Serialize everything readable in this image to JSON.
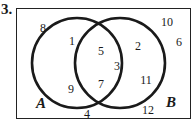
{
  "problem": {
    "number_label": "3."
  },
  "venn": {
    "sets": [
      {
        "name": "A",
        "label": "A"
      },
      {
        "name": "B",
        "label": "B"
      }
    ],
    "regions": {
      "only_A": [
        "1",
        "9"
      ],
      "intersection": [
        "5",
        "3",
        "7"
      ],
      "only_B": [
        "2",
        "11"
      ],
      "outside": [
        "8",
        "10",
        "6",
        "4",
        "12"
      ]
    },
    "numbers": {
      "n8": "8",
      "n1": "1",
      "n9": "9",
      "n5": "5",
      "n3": "3",
      "n7": "7",
      "n2": "2",
      "n11": "11",
      "n10": "10",
      "n6": "6",
      "n4": "4",
      "n12": "12"
    },
    "colors": {
      "stroke": "#1a1a1a",
      "background": "#ffffff"
    }
  }
}
